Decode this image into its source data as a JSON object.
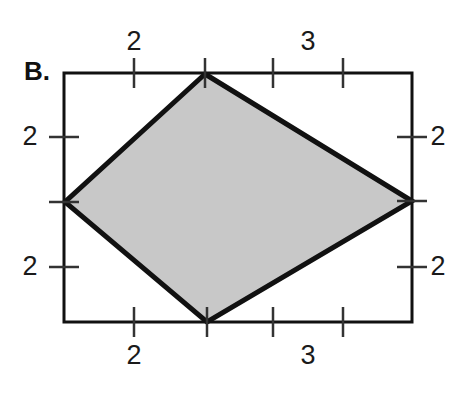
{
  "figure": {
    "panel_label": "B.",
    "colors": {
      "fill": "#c8c8c8",
      "stroke": "#111111",
      "frame": "#111111",
      "background": "#ffffff",
      "text": "#1a1a1a"
    },
    "frame": {
      "left": 64,
      "top": 73,
      "right": 412,
      "bottom": 322,
      "stroke_width": 3
    },
    "shape": {
      "name": "kite-quadrilateral",
      "stroke_width": 5,
      "vertices": [
        {
          "name": "top-vertex",
          "x": 205,
          "y": 74
        },
        {
          "name": "right-vertex",
          "x": 412,
          "y": 201
        },
        {
          "name": "bottom-vertex",
          "x": 207,
          "y": 322
        },
        {
          "name": "left-vertex",
          "x": 65,
          "y": 202
        }
      ]
    },
    "ticks": {
      "top": [
        {
          "x": 134,
          "label": "2"
        },
        {
          "x": 205,
          "label": ""
        },
        {
          "x": 273,
          "label": ""
        },
        {
          "x": 343,
          "label": "3"
        }
      ],
      "bottom": [
        {
          "x": 134,
          "label": "2"
        },
        {
          "x": 207,
          "label": ""
        },
        {
          "x": 273,
          "label": ""
        },
        {
          "x": 343,
          "label": "3"
        }
      ],
      "left": [
        {
          "y": 137,
          "label": "2"
        },
        {
          "y": 202,
          "label": ""
        },
        {
          "y": 267,
          "label": "2"
        }
      ],
      "right": [
        {
          "y": 137,
          "label": "2"
        },
        {
          "y": 201,
          "label": ""
        },
        {
          "y": 267,
          "label": "2"
        }
      ]
    },
    "labels": {
      "top_left_side": "2",
      "top_right_side": "3",
      "bottom_left_side": "2",
      "bottom_right_side": "3",
      "left_upper": "2",
      "left_lower": "2",
      "right_upper": "2",
      "right_lower": "2"
    }
  },
  "chart_data": {
    "type": "diagram",
    "title": "B.",
    "shape": "kite",
    "side_labels": {
      "top_left": "2",
      "top_right": "3",
      "bottom_left": "2",
      "bottom_right": "3",
      "left_upper": "2",
      "left_lower": "2",
      "right_upper": "2",
      "right_lower": "2"
    },
    "vertices": [
      {
        "name": "top",
        "x": 205,
        "y": 74
      },
      {
        "name": "right",
        "x": 412,
        "y": 201
      },
      {
        "name": "bottom",
        "x": 207,
        "y": 322
      },
      {
        "name": "left",
        "x": 65,
        "y": 202
      }
    ],
    "grid": false,
    "legend": null
  }
}
